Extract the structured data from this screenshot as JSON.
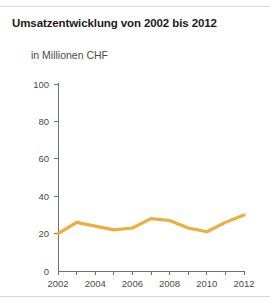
{
  "panel": {
    "title": "Umsatzentwicklung von 2002 bis 2012",
    "subtitle": "in Millionen CHF"
  },
  "chart_data": {
    "type": "line",
    "title": "Umsatzentwicklung von 2002 bis 2012",
    "subtitle": "in Millionen CHF",
    "xlabel": "",
    "ylabel": "in Millionen CHF",
    "x": [
      2002,
      2003,
      2004,
      2005,
      2006,
      2007,
      2008,
      2009,
      2010,
      2011,
      2012
    ],
    "values": [
      20,
      26,
      24,
      22,
      23,
      28,
      27,
      23,
      21,
      26,
      30
    ],
    "series": [
      {
        "name": "Umsatz",
        "values": [
          20,
          26,
          24,
          22,
          23,
          28,
          27,
          23,
          21,
          26,
          30
        ],
        "color": "#ECAE3F"
      }
    ],
    "xlim": [
      2002,
      2012
    ],
    "ylim": [
      0,
      100
    ],
    "y_ticks": [
      0,
      20,
      40,
      60,
      80,
      100
    ],
    "y_tick_labels": [
      "0",
      "20",
      "40",
      "60",
      "80",
      "100"
    ],
    "x_ticks": [
      2002,
      2003,
      2004,
      2005,
      2006,
      2007,
      2008,
      2009,
      2010,
      2011,
      2012
    ],
    "x_tick_labels": [
      "2002",
      "",
      "2004",
      "",
      "2006",
      "",
      "2008",
      "",
      "2010",
      "",
      "2012"
    ],
    "x_labeled": [
      "2002",
      "2004",
      "2006",
      "2008",
      "2010",
      "2012"
    ],
    "grid": false,
    "legend": false,
    "line_color": "#ECAE3F",
    "axis_color": "#6e7072"
  }
}
